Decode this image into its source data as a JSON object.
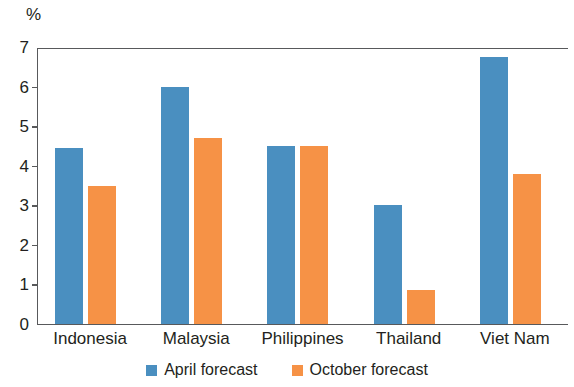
{
  "chart_data": {
    "type": "bar",
    "title": "",
    "subtitle": "",
    "xlabel": "",
    "ylabel": "%",
    "unit_label": "%",
    "categories": [
      "Indonesia",
      "Malaysia",
      "Philippines",
      "Thailand",
      "Viet Nam"
    ],
    "series": [
      {
        "name": "April forecast",
        "color": "#4A8FC0",
        "values": [
          4.45,
          6.0,
          4.5,
          3.0,
          6.75
        ]
      },
      {
        "name": "October forecast",
        "color": "#F69246",
        "values": [
          3.5,
          4.7,
          4.5,
          0.85,
          3.8
        ]
      }
    ],
    "ylim": [
      0,
      7
    ],
    "ytick_values": [
      0,
      1,
      2,
      3,
      4,
      5,
      6,
      7
    ],
    "ytick_labels": [
      "0",
      "1",
      "2",
      "3",
      "4",
      "5",
      "6",
      "7"
    ],
    "grid": false,
    "legend_position": "bottom-center",
    "axis_color": "#58595b",
    "text_color": "#231f20",
    "background": "#ffffff"
  }
}
